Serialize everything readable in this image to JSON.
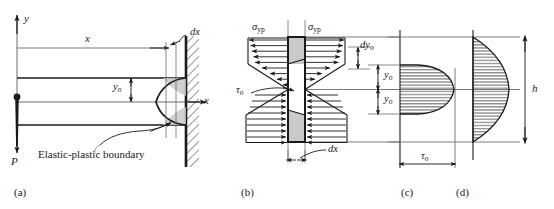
{
  "figure": {
    "panels": [
      {
        "key": "a",
        "label": "(a)",
        "x": 14,
        "y": 186,
        "caption": "Cantilever beam with elastic-plastic boundary"
      },
      {
        "key": "b",
        "label": "(b)",
        "x": 241,
        "y": 186,
        "caption": "Free-body element of width dx"
      },
      {
        "key": "c",
        "label": "(c)",
        "x": 401,
        "y": 186,
        "caption": "Shear stress distribution, elastic-plastic section"
      },
      {
        "key": "d",
        "label": "(d)",
        "x": 456,
        "y": 186,
        "caption": "Shear stress distribution, fully elastic section"
      }
    ]
  },
  "panel_a": {
    "axis_y": "y",
    "axis_x": "x",
    "dim_x": "x",
    "dim_dx": "dx",
    "dim_y0": "y",
    "dim_y0_sub": "o",
    "load": "P",
    "boundary_note": "Elastic-plastic boundary"
  },
  "panel_b": {
    "sigma_left": "σ",
    "sigma_left_sub": "yp",
    "sigma_right": "σ",
    "sigma_right_sub": "yp",
    "tau": "τ",
    "tau_sub": "o",
    "dy0": "dy",
    "dy0_sub": "o",
    "dim_dx": "dx"
  },
  "panel_c": {
    "y0_upper": "y",
    "y0_upper_sub": "o",
    "y0_lower": "y",
    "y0_lower_sub": "o",
    "tau_dim": "τ",
    "tau_dim_sub": "o"
  },
  "panel_d": {
    "height_dim": "h"
  },
  "style": {
    "line_color": "#1a1a1a",
    "thin_color": "#6d6d6d",
    "shade_fill": "#c9c9c9",
    "hatch_color": "#1a1a1a",
    "background": "#ffffff"
  }
}
